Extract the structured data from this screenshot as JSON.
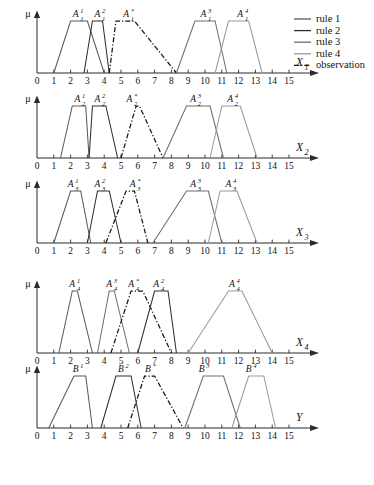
{
  "figure": {
    "axis_mu_label": "μ",
    "x_tick_labels": [
      "0",
      "1",
      "2",
      "3",
      "4",
      "5",
      "6",
      "7",
      "8",
      "9",
      "10",
      "11",
      "12",
      "13",
      "14",
      "15"
    ],
    "x_domain": [
      0,
      15
    ]
  },
  "colors": {
    "rule1": "#595959",
    "rule2": "#2e2e2e",
    "rule3": "#6e6e6e",
    "rule4": "#9a9a9a",
    "observation": "#151515",
    "axis": "#2b2b2b",
    "text": "#111111",
    "background": "#ffffff"
  },
  "legend": {
    "items": [
      {
        "label": "rule 1",
        "color_key": "rule1",
        "style": "solid"
      },
      {
        "label": "rule 2",
        "color_key": "rule2",
        "style": "solid"
      },
      {
        "label": "rule 3",
        "color_key": "rule3",
        "style": "solid"
      },
      {
        "label": "rule 4",
        "color_key": "rule4",
        "style": "solid"
      },
      {
        "label": "observation",
        "color_key": "observation",
        "style": "dashdot"
      }
    ]
  },
  "chart_data": [
    {
      "type": "line",
      "id": "panel-x1",
      "xlabel": "X",
      "xlabel_sub": "1",
      "ylabel": "μ",
      "xlim": [
        0,
        15
      ],
      "ylim": [
        0,
        1
      ],
      "grid": false,
      "series": [
        {
          "name": "A_1^1",
          "label_base": "A",
          "label_sup": "1",
          "label_sub": "1",
          "label_x": 2.3,
          "color_key": "rule1",
          "style": "solid",
          "points": [
            [
              1,
              0
            ],
            [
              2,
              1
            ],
            [
              3,
              1
            ],
            [
              4,
              0
            ]
          ]
        },
        {
          "name": "A_1^2",
          "label_base": "A",
          "label_sup": "2",
          "label_sub": "1",
          "label_x": 3.6,
          "color_key": "rule2",
          "style": "solid",
          "points": [
            [
              2.8,
              0
            ],
            [
              3.3,
              1
            ],
            [
              3.9,
              1
            ],
            [
              4.3,
              0
            ]
          ]
        },
        {
          "name": "A_1^*",
          "label_base": "A",
          "label_sup": "*",
          "label_sub": "1",
          "label_x": 5.3,
          "color_key": "observation",
          "style": "dashdot",
          "points": [
            [
              4.3,
              0
            ],
            [
              4.7,
              1
            ],
            [
              5.8,
              1
            ],
            [
              8.3,
              0
            ]
          ]
        },
        {
          "name": "A_1^3",
          "label_base": "A",
          "label_sup": "3",
          "label_sub": "1",
          "label_x": 9.9,
          "color_key": "rule3",
          "style": "solid",
          "points": [
            [
              8.3,
              0
            ],
            [
              9.4,
              1
            ],
            [
              10.6,
              1
            ],
            [
              11.3,
              0
            ]
          ]
        },
        {
          "name": "A_1^4",
          "label_base": "A",
          "label_sup": "4",
          "label_sub": "1",
          "label_x": 12.1,
          "color_key": "rule4",
          "style": "solid",
          "points": [
            [
              10.6,
              0
            ],
            [
              11.4,
              1
            ],
            [
              12.6,
              1
            ],
            [
              13.4,
              0
            ]
          ]
        }
      ]
    },
    {
      "type": "line",
      "id": "panel-x2",
      "xlabel": "X",
      "xlabel_sub": "2",
      "ylabel": "μ",
      "xlim": [
        0,
        15
      ],
      "ylim": [
        0,
        1
      ],
      "grid": false,
      "series": [
        {
          "name": "A_2^1",
          "label_base": "A",
          "label_sup": "1",
          "label_sub": "2",
          "label_x": 2.4,
          "color_key": "rule1",
          "style": "solid",
          "points": [
            [
              1.4,
              0
            ],
            [
              2.1,
              1
            ],
            [
              2.9,
              1
            ],
            [
              3.1,
              0
            ]
          ]
        },
        {
          "name": "A_2^2",
          "label_base": "A",
          "label_sup": "2",
          "label_sub": "2",
          "label_x": 3.6,
          "color_key": "rule2",
          "style": "solid",
          "points": [
            [
              3.1,
              0
            ],
            [
              3.3,
              1
            ],
            [
              4.1,
              1
            ],
            [
              4.8,
              0
            ]
          ]
        },
        {
          "name": "A_2^*",
          "label_base": "A",
          "label_sup": "*",
          "label_sub": "2",
          "label_x": 5.5,
          "color_key": "observation",
          "style": "dashdot",
          "points": [
            [
              5.0,
              0
            ],
            [
              5.9,
              1
            ],
            [
              6.1,
              1
            ],
            [
              7.5,
              0
            ]
          ]
        },
        {
          "name": "A_2^3",
          "label_base": "A",
          "label_sup": "3",
          "label_sub": "2",
          "label_x": 9.3,
          "color_key": "rule3",
          "style": "solid",
          "points": [
            [
              7.5,
              0
            ],
            [
              8.9,
              1
            ],
            [
              10.3,
              1
            ],
            [
              11.1,
              0
            ]
          ]
        },
        {
          "name": "A_2^4",
          "label_base": "A",
          "label_sup": "4",
          "label_sub": "2",
          "label_x": 11.5,
          "color_key": "rule4",
          "style": "solid",
          "points": [
            [
              10.3,
              0
            ],
            [
              11.0,
              1
            ],
            [
              12.1,
              1
            ],
            [
              13.1,
              0
            ]
          ]
        }
      ]
    },
    {
      "type": "line",
      "id": "panel-x3",
      "xlabel": "X",
      "xlabel_sub": "3",
      "ylabel": "μ",
      "xlim": [
        0,
        15
      ],
      "ylim": [
        0,
        1
      ],
      "grid": false,
      "series": [
        {
          "name": "A_3^1",
          "label_base": "A",
          "label_sup": "1",
          "label_sub": "3",
          "label_x": 2.0,
          "color_key": "rule1",
          "style": "solid",
          "points": [
            [
              1.0,
              0
            ],
            [
              2.0,
              1
            ],
            [
              2.6,
              1
            ],
            [
              3.2,
              0
            ]
          ]
        },
        {
          "name": "A_3^2",
          "label_base": "A",
          "label_sup": "2",
          "label_sub": "3",
          "label_x": 3.6,
          "color_key": "rule2",
          "style": "solid",
          "points": [
            [
              3.0,
              0
            ],
            [
              3.6,
              1
            ],
            [
              4.3,
              1
            ],
            [
              5.0,
              0
            ]
          ]
        },
        {
          "name": "A_3^*",
          "label_base": "A",
          "label_sup": "*",
          "label_sub": "3",
          "label_x": 5.7,
          "color_key": "observation",
          "style": "dashdot",
          "points": [
            [
              4.1,
              0
            ],
            [
              5.3,
              1
            ],
            [
              5.8,
              1
            ],
            [
              6.6,
              0
            ]
          ]
        },
        {
          "name": "A_3^3",
          "label_base": "A",
          "label_sup": "3",
          "label_sub": "3",
          "label_x": 9.3,
          "color_key": "rule3",
          "style": "solid",
          "points": [
            [
              6.9,
              0
            ],
            [
              8.9,
              1
            ],
            [
              10.2,
              1
            ],
            [
              11.0,
              0
            ]
          ]
        },
        {
          "name": "A_3^4",
          "label_base": "A",
          "label_sup": "4",
          "label_sub": "3",
          "label_x": 11.4,
          "color_key": "rule4",
          "style": "solid",
          "points": [
            [
              10.2,
              0
            ],
            [
              10.9,
              1
            ],
            [
              11.9,
              1
            ],
            [
              13.1,
              0
            ]
          ]
        }
      ]
    },
    {
      "type": "line",
      "id": "panel-x4",
      "xlabel": "X",
      "xlabel_sub": "4",
      "ylabel": "μ",
      "xlim": [
        0,
        15
      ],
      "ylim": [
        0,
        1
      ],
      "grid": false,
      "series": [
        {
          "name": "A_4^1",
          "label_base": "A",
          "label_sup": "1",
          "label_sub": "4",
          "label_x": 2.1,
          "color_key": "rule1",
          "style": "solid",
          "points": [
            [
              1.3,
              0
            ],
            [
              2.1,
              1
            ],
            [
              2.4,
              1
            ],
            [
              3.3,
              0
            ]
          ]
        },
        {
          "name": "A_4^3",
          "label_base": "A",
          "label_sup": "3",
          "label_sub": "4",
          "label_x": 4.3,
          "color_key": "rule3",
          "style": "solid",
          "points": [
            [
              3.6,
              0
            ],
            [
              4.3,
              1
            ],
            [
              4.6,
              1
            ],
            [
              5.5,
              0
            ]
          ]
        },
        {
          "name": "A_4^*",
          "label_base": "A",
          "label_sup": "*",
          "label_sub": "4",
          "label_x": 5.6,
          "color_key": "observation",
          "style": "dashdot",
          "points": [
            [
              4.4,
              0
            ],
            [
              5.6,
              1
            ],
            [
              6.3,
              1
            ],
            [
              8.0,
              0
            ]
          ]
        },
        {
          "name": "A_4^2",
          "label_base": "A",
          "label_sup": "2",
          "label_sub": "4",
          "label_x": 7.1,
          "color_key": "rule2",
          "style": "solid",
          "points": [
            [
              6.0,
              0
            ],
            [
              7.0,
              1
            ],
            [
              7.8,
              1
            ],
            [
              8.3,
              0
            ]
          ]
        },
        {
          "name": "A_4^4",
          "label_base": "A",
          "label_sup": "4",
          "label_sub": "4",
          "label_x": 11.6,
          "color_key": "rule4",
          "style": "solid",
          "points": [
            [
              9.0,
              0
            ],
            [
              11.4,
              1
            ],
            [
              12.2,
              1
            ],
            [
              14.0,
              0
            ]
          ]
        }
      ]
    },
    {
      "type": "line",
      "id": "panel-y",
      "xlabel": "Y",
      "xlabel_sub": "",
      "ylabel": "μ",
      "xlim": [
        0,
        15
      ],
      "ylim": [
        0,
        1
      ],
      "grid": false,
      "series": [
        {
          "name": "B^1",
          "label_base": "B",
          "label_sup": "1",
          "label_sub": "",
          "label_x": 2.3,
          "color_key": "rule1",
          "style": "solid",
          "points": [
            [
              0.7,
              0
            ],
            [
              2.2,
              1
            ],
            [
              2.9,
              1
            ],
            [
              3.3,
              0
            ]
          ]
        },
        {
          "name": "B^2",
          "label_base": "B",
          "label_sup": "2",
          "label_sub": "",
          "label_x": 5.0,
          "color_key": "rule2",
          "style": "solid",
          "points": [
            [
              3.8,
              0
            ],
            [
              4.7,
              1
            ],
            [
              5.6,
              1
            ],
            [
              6.2,
              0
            ]
          ]
        },
        {
          "name": "B^*",
          "label_base": "B",
          "label_sup": "*",
          "label_sub": "",
          "label_x": 6.6,
          "color_key": "observation",
          "style": "dashdot",
          "points": [
            [
              5.4,
              0
            ],
            [
              6.4,
              1
            ],
            [
              7.0,
              1
            ],
            [
              8.7,
              0
            ]
          ]
        },
        {
          "name": "B^3",
          "label_base": "B",
          "label_sup": "3",
          "label_sub": "",
          "label_x": 9.8,
          "color_key": "rule3",
          "style": "solid",
          "points": [
            [
              8.8,
              0
            ],
            [
              9.9,
              1
            ],
            [
              11.1,
              1
            ],
            [
              12.1,
              0
            ]
          ]
        },
        {
          "name": "B^4",
          "label_base": "B",
          "label_sup": "4",
          "label_sub": "",
          "label_x": 12.6,
          "color_key": "rule4",
          "style": "solid",
          "points": [
            [
              11.6,
              0
            ],
            [
              12.6,
              1
            ],
            [
              13.5,
              1
            ],
            [
              14.2,
              0
            ]
          ]
        }
      ]
    }
  ]
}
